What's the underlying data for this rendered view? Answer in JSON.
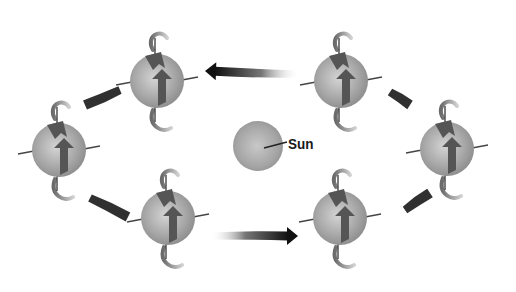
{
  "diagram": {
    "type": "orbital-rotation",
    "center": {
      "label": "Sun",
      "x": 258,
      "y": 146,
      "r": 25,
      "color": "#9a9a9a"
    },
    "spheres": [
      {
        "id": "top-left",
        "x": 157,
        "y": 81,
        "r": 27
      },
      {
        "id": "top-right",
        "x": 341,
        "y": 81,
        "r": 27
      },
      {
        "id": "right",
        "x": 447,
        "y": 149,
        "r": 27
      },
      {
        "id": "bottom-right",
        "x": 340,
        "y": 218,
        "r": 27
      },
      {
        "id": "bottom-left",
        "x": 168,
        "y": 218,
        "r": 27
      },
      {
        "id": "left",
        "x": 59,
        "y": 150,
        "r": 27
      }
    ],
    "orbit_arrows": [
      {
        "id": "top",
        "x1": 300,
        "y1": 74,
        "x2": 205,
        "y2": 71,
        "head": true
      },
      {
        "id": "bottom",
        "x1": 210,
        "y1": 236,
        "x2": 298,
        "y2": 236,
        "head": true
      },
      {
        "id": "upper-left",
        "x1": 120,
        "y1": 90,
        "x2": 85,
        "y2": 105,
        "head": false
      },
      {
        "id": "lower-left",
        "x1": 90,
        "y1": 198,
        "x2": 128,
        "y2": 217,
        "head": false
      },
      {
        "id": "upper-right",
        "x1": 390,
        "y1": 92,
        "x2": 410,
        "y2": 105,
        "head": false
      },
      {
        "id": "lower-right",
        "x1": 405,
        "y1": 210,
        "x2": 430,
        "y2": 193,
        "head": false
      }
    ],
    "colors": {
      "sphere_light": "#d8d8d8",
      "sphere_dark": "#8a8a8a",
      "arrow_dark": "#1a1a1a",
      "spin_arrow": "#555555",
      "axis": "#444444"
    }
  }
}
